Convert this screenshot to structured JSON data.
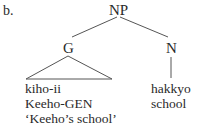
{
  "example": {
    "label": "b.",
    "tree": {
      "root": "NP",
      "children": [
        {
          "node": "G",
          "roof": true,
          "lines": [
            "kiho-ii",
            "Keeho-GEN",
            "‘Keeho’s school’"
          ]
        },
        {
          "node": "N",
          "roof": false,
          "lines": [
            "hakkyo",
            "school"
          ]
        }
      ]
    }
  }
}
